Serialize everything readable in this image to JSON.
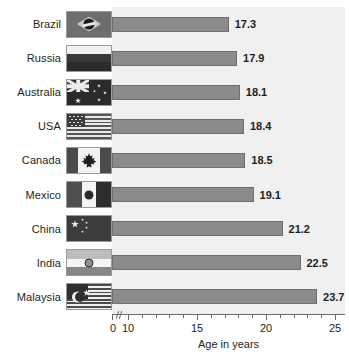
{
  "chart_data": {
    "type": "bar",
    "orientation": "horizontal",
    "title": "",
    "xlabel": "Age in years",
    "ylabel": "",
    "categories": [
      "Brazil",
      "Russia",
      "Australia",
      "USA",
      "Canada",
      "Mexico",
      "China",
      "India",
      "Malaysia"
    ],
    "values": [
      17.3,
      17.9,
      18.1,
      18.4,
      18.5,
      19.1,
      21.2,
      22.5,
      23.7
    ],
    "value_labels": [
      "17.3",
      "17.9",
      "18.1",
      "18.4",
      "18.5",
      "19.1",
      "21.2",
      "22.5",
      "23.7"
    ],
    "xlim": [
      10,
      25
    ],
    "axis_origin_label": "0",
    "axis_break": true,
    "xticks": [
      10,
      11,
      12,
      13,
      14,
      15,
      16,
      17,
      18,
      19,
      20,
      21,
      22,
      23,
      24,
      25
    ],
    "xtick_labels": [
      "10",
      "",
      "",
      "",
      "",
      "15",
      "",
      "",
      "",
      "",
      "20",
      "",
      "",
      "",
      "",
      "25"
    ],
    "grid": false,
    "legend": "none",
    "bar_color": "#8b8b8b",
    "bar_border_color": "#6f6f6f",
    "plot_background": "#f0f0f0",
    "text_color": "#231f20"
  },
  "categories": [
    {
      "label": "Brazil",
      "value_label": "17.3",
      "flag": "flag-brazil"
    },
    {
      "label": "Russia",
      "value_label": "17.9",
      "flag": "flag-russia"
    },
    {
      "label": "Australia",
      "value_label": "18.1",
      "flag": "flag-australia"
    },
    {
      "label": "USA",
      "value_label": "18.4",
      "flag": "flag-usa"
    },
    {
      "label": "Canada",
      "value_label": "18.5",
      "flag": "flag-canada"
    },
    {
      "label": "Mexico",
      "value_label": "19.1",
      "flag": "flag-mexico"
    },
    {
      "label": "China",
      "value_label": "21.2",
      "flag": "flag-china"
    },
    {
      "label": "India",
      "value_label": "22.5",
      "flag": "flag-india"
    },
    {
      "label": "Malaysia",
      "value_label": "23.7",
      "flag": "flag-malaysia"
    }
  ],
  "axis": {
    "origin": "0",
    "labels": [
      "10",
      "15",
      "20",
      "25"
    ],
    "title": "Age in years"
  }
}
